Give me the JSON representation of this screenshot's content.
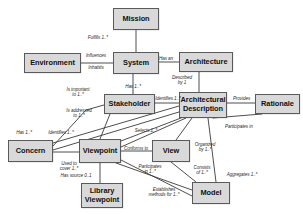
{
  "diagram": {
    "style": {
      "node_fill": "#d9d9d9",
      "node_border": "#5a5a5a",
      "edge_color": "#3a3a3a",
      "background": "#ffffff",
      "label_color": "#2a2a2a"
    },
    "nodes": [
      {
        "id": "mission",
        "label": "Mission",
        "x": 113,
        "y": 8,
        "w": 46,
        "h": 22
      },
      {
        "id": "environment",
        "label": "Environment",
        "x": 24,
        "y": 53,
        "w": 57,
        "h": 20
      },
      {
        "id": "system",
        "label": "System",
        "x": 113,
        "y": 52,
        "w": 46,
        "h": 22
      },
      {
        "id": "architecture",
        "label": "Architecture",
        "x": 179,
        "y": 52,
        "w": 54,
        "h": 20
      },
      {
        "id": "stakeholder",
        "label": "Stakeholder",
        "x": 104,
        "y": 94,
        "w": 51,
        "h": 20
      },
      {
        "id": "arch-description",
        "label": "Architectural\nDescription",
        "x": 179,
        "y": 92,
        "w": 48,
        "h": 26
      },
      {
        "id": "rationale",
        "label": "Rationale",
        "x": 255,
        "y": 94,
        "w": 45,
        "h": 20
      },
      {
        "id": "concern",
        "label": "Concern",
        "x": 8,
        "y": 140,
        "w": 45,
        "h": 22
      },
      {
        "id": "viewpoint",
        "label": "Viewpoint",
        "x": 79,
        "y": 139,
        "w": 42,
        "h": 24
      },
      {
        "id": "view",
        "label": "View",
        "x": 152,
        "y": 140,
        "w": 38,
        "h": 22
      },
      {
        "id": "library-viewpoint",
        "label": "Library\nViewpoint",
        "x": 81,
        "y": 183,
        "w": 42,
        "h": 25
      },
      {
        "id": "model",
        "label": "Model",
        "x": 192,
        "y": 182,
        "w": 38,
        "h": 22
      }
    ],
    "edges": [
      {
        "id": "mission-system",
        "from": "Mission",
        "to": "System",
        "label": "Fulfills 1..*"
      },
      {
        "id": "environment-system",
        "from": "Environment",
        "to": "System",
        "label": "Influences\nInhabits"
      },
      {
        "id": "system-architecture",
        "from": "System",
        "to": "Architecture",
        "label": "Has an"
      },
      {
        "id": "architecture-archdesc",
        "from": "Architecture",
        "to": "Architectural Description",
        "label": "Described\nby 1"
      },
      {
        "id": "system-stakeholder",
        "from": "System",
        "to": "Stakeholder",
        "label": "Has 1..*"
      },
      {
        "id": "stakeholder-archdesc",
        "from": "Stakeholder",
        "to": "Architectural Description",
        "label": "Identifies 1..*"
      },
      {
        "id": "archdesc-rationale",
        "from": "Architectural Description",
        "to": "Rationale",
        "label": "Provides"
      },
      {
        "id": "concern-stakeholder",
        "from": "Concern",
        "to": "Stakeholder",
        "label": "Is important\nto 1..*"
      },
      {
        "id": "archdesc-concern",
        "from": "Architectural Description",
        "to": "Concern",
        "label": "Is addressed\nto 1..*"
      },
      {
        "id": "concern-has",
        "from": "Concern",
        "to": "Architectural Description",
        "label": "Has 1..*"
      },
      {
        "id": "viewpoint-identifies",
        "from": "Viewpoint",
        "to": "Concern",
        "label": "Identifies 1..*"
      },
      {
        "id": "archdesc-viewpoint-selects",
        "from": "Architectural Description",
        "to": "Viewpoint",
        "label": "Selects 1..*"
      },
      {
        "id": "concern-viewpoint",
        "from": "Concern",
        "to": "Viewpoint",
        "label": "Used to\ncover 1..*"
      },
      {
        "id": "view-viewpoint",
        "from": "View",
        "to": "Viewpoint",
        "label": "Conforms to"
      },
      {
        "id": "archdesc-view-organized",
        "from": "Architectural Description",
        "to": "View",
        "label": "Organized\nby 1..*"
      },
      {
        "id": "rationale-participates",
        "from": "Rationale",
        "to": "Architectural Description",
        "label": "Participates in"
      },
      {
        "id": "viewpoint-library",
        "from": "Viewpoint",
        "to": "Library Viewpoint",
        "label": "Has source 0..1"
      },
      {
        "id": "viewpoint-model",
        "from": "Viewpoint",
        "to": "Model",
        "label": "Participates\nin 1..*"
      },
      {
        "id": "view-model-consists",
        "from": "View",
        "to": "Model",
        "label": "Consists\nof 1..*"
      },
      {
        "id": "archdesc-model-aggregates",
        "from": "Architectural Description",
        "to": "Model",
        "label": "Aggregates 1..*"
      },
      {
        "id": "viewpoint-model-establishes",
        "from": "Viewpoint",
        "to": "Model",
        "label": "Establishes\nmethods for 1..*"
      }
    ],
    "edge_labels": [
      {
        "id": "lbl-fulfills",
        "text": "Fulfills 1..*",
        "x": 66,
        "y": 35,
        "w": 42,
        "align": "right"
      },
      {
        "id": "lbl-influences",
        "text": "Influences",
        "x": 81,
        "y": 53,
        "w": 30,
        "align": "center"
      },
      {
        "id": "lbl-inhabits",
        "text": "Inhabits",
        "x": 81,
        "y": 65,
        "w": 30,
        "align": "center"
      },
      {
        "id": "lbl-has-an",
        "text": "Has an",
        "x": 154,
        "y": 56,
        "w": 24,
        "align": "center"
      },
      {
        "id": "lbl-described-by",
        "text": "Described\nby 1",
        "x": 166,
        "y": 75,
        "w": 32,
        "align": "center"
      },
      {
        "id": "lbl-has-1",
        "text": "Has 1..*",
        "x": 119,
        "y": 84,
        "w": 28,
        "align": "center"
      },
      {
        "id": "lbl-identifies-ad",
        "text": "Identifies 1..*",
        "x": 152,
        "y": 96,
        "w": 32,
        "align": "center"
      },
      {
        "id": "lbl-provides",
        "text": "Provides",
        "x": 228,
        "y": 96,
        "w": 27,
        "align": "center"
      },
      {
        "id": "lbl-is-important",
        "text": "Is important\nto 1..*",
        "x": 58,
        "y": 87,
        "w": 40,
        "align": "center"
      },
      {
        "id": "lbl-is-addressed",
        "text": "Is addressed\nto 1..*",
        "x": 59,
        "y": 108,
        "w": 40,
        "align": "center"
      },
      {
        "id": "lbl-participates-in",
        "text": "Participates in",
        "x": 225,
        "y": 124,
        "w": 42,
        "align": "left"
      },
      {
        "id": "lbl-has-1b",
        "text": "Has 1..*",
        "x": 10,
        "y": 130,
        "w": 28,
        "align": "center"
      },
      {
        "id": "lbl-identifies-vp",
        "text": "Identifies 1..*",
        "x": 43,
        "y": 130,
        "w": 36,
        "align": "center"
      },
      {
        "id": "lbl-selects",
        "text": "Selects 1..*",
        "x": 129,
        "y": 128,
        "w": 34,
        "align": "center"
      },
      {
        "id": "lbl-conforms",
        "text": "Conforms to",
        "x": 119,
        "y": 146,
        "w": 34,
        "align": "center"
      },
      {
        "id": "lbl-used-to-cover",
        "text": "Used to\ncover 1..*",
        "x": 54,
        "y": 161,
        "w": 30,
        "align": "center"
      },
      {
        "id": "lbl-organized",
        "text": "Organized\nby 1..*",
        "x": 190,
        "y": 142,
        "w": 30,
        "align": "center"
      },
      {
        "id": "lbl-participates",
        "text": "Participates\nin 1..*",
        "x": 133,
        "y": 164,
        "w": 34,
        "align": "center"
      },
      {
        "id": "lbl-consists",
        "text": "Consists\nof 1..*",
        "x": 188,
        "y": 165,
        "w": 28,
        "align": "center"
      },
      {
        "id": "lbl-aggregates",
        "text": "Aggregates 1..*",
        "x": 220,
        "y": 172,
        "w": 44,
        "align": "center"
      },
      {
        "id": "lbl-has-source",
        "text": "Has source 0..1",
        "x": 54,
        "y": 173,
        "w": 44,
        "align": "center"
      },
      {
        "id": "lbl-establishes",
        "text": "Establishes\nmethods for 1..*",
        "x": 140,
        "y": 187,
        "w": 48,
        "align": "center"
      }
    ],
    "connectors": [
      {
        "id": "c-mission-system",
        "d": "M136,30 L136,52"
      },
      {
        "id": "c-environment-system",
        "d": "M81,63 L113,63"
      },
      {
        "id": "c-system-architecture",
        "d": "M159,62 L179,62"
      },
      {
        "id": "c-architecture-archdesc",
        "d": "M199,72 L199,92"
      },
      {
        "id": "c-system-stakeholder",
        "d": "M133,74 L133,94"
      },
      {
        "id": "c-stakeholder-archdesc",
        "d": "M155,103 L179,103"
      },
      {
        "id": "c-archdesc-rationale",
        "d": "M227,103 L255,103"
      },
      {
        "id": "c-concern-stakeholder",
        "d": "M53,146 L86,110 L104,105"
      },
      {
        "id": "c-archdesc-concern-a",
        "d": "M179,106 L53,143"
      },
      {
        "id": "c-archdesc-concern-b",
        "d": "M179,112 L53,150"
      },
      {
        "id": "c-stakeholder-viewpoint",
        "d": "M110,114 L100,139"
      },
      {
        "id": "c-archdesc-viewpoint-1",
        "d": "M181,118 L121,141"
      },
      {
        "id": "c-archdesc-viewpoint-2",
        "d": "M186,118 L121,147"
      },
      {
        "id": "c-concern-viewpoint",
        "d": "M53,152 L79,152"
      },
      {
        "id": "c-view-viewpoint",
        "d": "M121,151 L152,151"
      },
      {
        "id": "c-archdesc-view",
        "d": "M192,118 L176,140"
      },
      {
        "id": "c-rationale-archdesc",
        "d": "M262,114 L213,118"
      },
      {
        "id": "c-viewpoint-library",
        "d": "M100,163 L100,183"
      },
      {
        "id": "c-viewpoint-model",
        "d": "M116,163 L192,190"
      },
      {
        "id": "c-view-model",
        "d": "M171,162 L196,182"
      },
      {
        "id": "c-archdesc-model",
        "d": "M208,118 L216,182"
      },
      {
        "id": "c-viewpoint-model-est",
        "d": "M121,160 L192,196"
      }
    ]
  }
}
